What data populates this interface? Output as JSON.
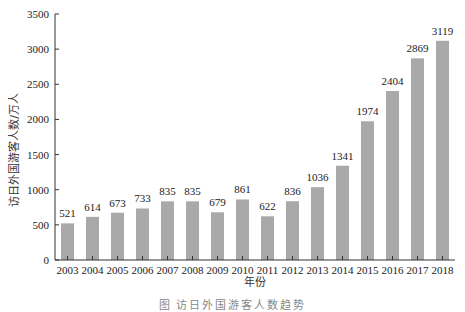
{
  "chart_data": {
    "type": "bar",
    "title": "",
    "xlabel": "年份",
    "ylabel": "访日外国游客人数/万人",
    "categories": [
      "2003",
      "2004",
      "2005",
      "2006",
      "2007",
      "2008",
      "2009",
      "2010",
      "2011",
      "2012",
      "2013",
      "2014",
      "2015",
      "2016",
      "2017",
      "2018"
    ],
    "values": [
      521,
      614,
      673,
      733,
      835,
      835,
      679,
      861,
      622,
      836,
      1036,
      1341,
      1974,
      2404,
      2869,
      3119
    ],
    "ylim": [
      0,
      3500
    ],
    "yticks": [
      0,
      500,
      1000,
      1500,
      2000,
      2500,
      3000,
      3500
    ],
    "grid": false,
    "legend": null,
    "bar_color": "#a9a9a9",
    "data_labels": true
  },
  "caption": "图 访日外国游客人数趋势"
}
